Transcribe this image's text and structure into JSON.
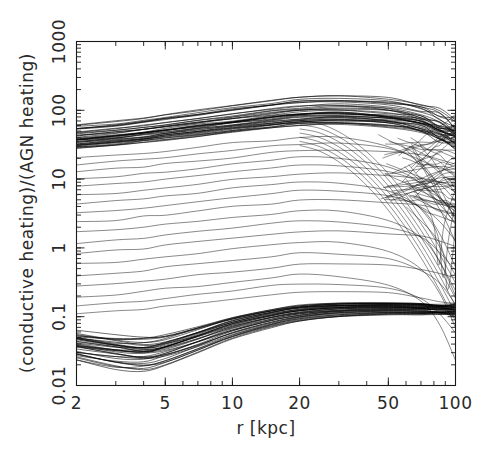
{
  "figure": {
    "title": "",
    "background_color": "#ffffff",
    "line_color": "#111111"
  },
  "chart_data": {
    "type": "line",
    "title": "",
    "subtitle": "",
    "xlabel": "r [kpc]",
    "ylabel": "(conductive heating)/(AGN heating)",
    "xscale": "log",
    "yscale": "log",
    "xlim": [
      2,
      100
    ],
    "ylim": [
      0.01,
      1000
    ],
    "grid": false,
    "legend": null,
    "legend_position": "none",
    "xticks": [
      2,
      5,
      10,
      20,
      50,
      100
    ],
    "xticklabels": [
      "2",
      "5",
      "10",
      "20",
      "50",
      "100"
    ],
    "yticks": [
      0.01,
      0.1,
      1,
      10,
      100,
      1000
    ],
    "yticklabels": [
      "0.01",
      "0.1",
      "1",
      "10",
      "100",
      "1000"
    ],
    "x_minor_ticks": [
      3,
      4,
      6,
      7,
      8,
      9,
      30,
      40,
      60,
      70,
      80,
      90
    ],
    "annotations": [],
    "x_sample": [
      2,
      3,
      4,
      5,
      7,
      10,
      15,
      20,
      30,
      50,
      70,
      85,
      100
    ],
    "series": [
      {
        "name": "upper-bundle-top",
        "group": "upper",
        "values": [
          62,
          70,
          78,
          86,
          100,
          118,
          140,
          155,
          165,
          150,
          120,
          95,
          70
        ]
      },
      {
        "name": "upper-bundle-core",
        "group": "upper",
        "values": [
          40,
          45,
          50,
          55,
          63,
          72,
          84,
          92,
          96,
          88,
          72,
          58,
          45
        ]
      },
      {
        "name": "upper-bundle-low",
        "group": "upper",
        "values": [
          28,
          31,
          34,
          37,
          42,
          48,
          55,
          60,
          62,
          57,
          47,
          38,
          30
        ]
      },
      {
        "name": "intermediate-1",
        "group": "sparse",
        "values": [
          20,
          22,
          24,
          26,
          29,
          33,
          37,
          40,
          41,
          37,
          30,
          24,
          18
        ]
      },
      {
        "name": "intermediate-2",
        "group": "sparse",
        "values": [
          12,
          13,
          14,
          15,
          17,
          19,
          22,
          24,
          24,
          22,
          18,
          14,
          10
        ]
      },
      {
        "name": "intermediate-3",
        "group": "sparse",
        "values": [
          6,
          6.6,
          7.2,
          7.8,
          8.8,
          10,
          11.5,
          12.4,
          12.6,
          11.4,
          9.2,
          7.2,
          5.2
        ]
      },
      {
        "name": "intermediate-4",
        "group": "sparse",
        "values": [
          3,
          3.3,
          3.6,
          3.9,
          4.4,
          5.0,
          5.7,
          6.2,
          6.3,
          5.7,
          4.6,
          3.6,
          2.6
        ]
      },
      {
        "name": "intermediate-5",
        "group": "sparse",
        "values": [
          1.3,
          1.43,
          1.56,
          1.69,
          1.9,
          2.17,
          2.48,
          2.69,
          2.73,
          2.47,
          2.0,
          1.56,
          1.12
        ]
      },
      {
        "name": "intermediate-6",
        "group": "sparse",
        "values": [
          0.55,
          0.6,
          0.66,
          0.72,
          0.81,
          0.92,
          1.05,
          1.14,
          1.16,
          1.05,
          0.85,
          0.66,
          0.48
        ]
      },
      {
        "name": "intermediate-7",
        "group": "sparse",
        "values": [
          0.22,
          0.24,
          0.26,
          0.29,
          0.32,
          0.37,
          0.42,
          0.46,
          0.46,
          0.42,
          0.34,
          0.27,
          0.19
        ]
      },
      {
        "name": "intermediate-8",
        "group": "sparse",
        "values": [
          0.11,
          0.12,
          0.13,
          0.14,
          0.16,
          0.18,
          0.21,
          0.23,
          0.23,
          0.21,
          0.17,
          0.13,
          0.1
        ]
      },
      {
        "name": "lower-bundle-top",
        "group": "lower",
        "values": [
          0.058,
          0.05,
          0.048,
          0.052,
          0.07,
          0.098,
          0.128,
          0.146,
          0.158,
          0.16,
          0.155,
          0.15,
          0.145
        ]
      },
      {
        "name": "lower-bundle-core",
        "group": "lower",
        "values": [
          0.04,
          0.034,
          0.032,
          0.036,
          0.05,
          0.073,
          0.1,
          0.118,
          0.132,
          0.136,
          0.133,
          0.13,
          0.126
        ]
      },
      {
        "name": "lower-bundle-bot",
        "group": "lower",
        "values": [
          0.024,
          0.019,
          0.018,
          0.021,
          0.031,
          0.048,
          0.07,
          0.086,
          0.1,
          0.107,
          0.107,
          0.106,
          0.105
        ]
      }
    ],
    "n_curves_total": 92,
    "n_curves_upper_bundle": 38,
    "n_curves_sparse": 18,
    "n_curves_lower_bundle": 36
  }
}
